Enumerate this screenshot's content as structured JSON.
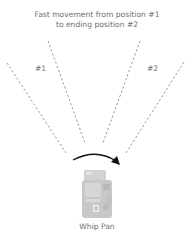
{
  "title": {
    "line1": "Fast movement from position #1",
    "line2": "to ending position #2"
  },
  "labels": {
    "position1": "#1",
    "position2": "#2"
  },
  "caption": "Whip Pan",
  "colors": {
    "dashed_lines": "#8a8a8a",
    "arrow": "#111111",
    "camera": "#c8c8c8",
    "text": "#707070"
  },
  "icons": {
    "camera": "camera-icon",
    "arrow": "curved-arrow-icon"
  }
}
